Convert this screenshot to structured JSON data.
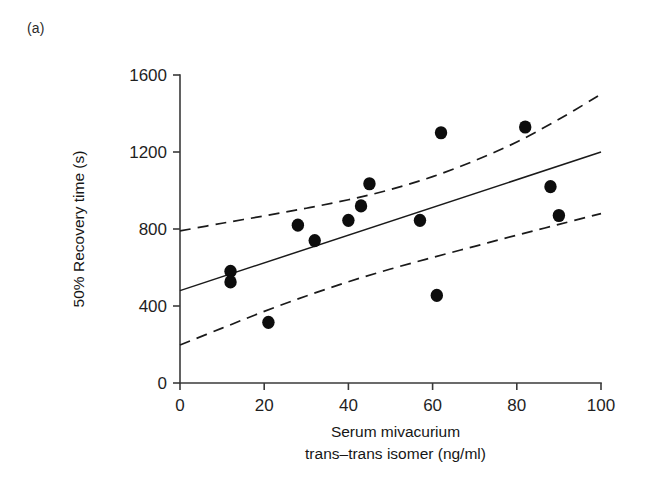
{
  "panel": {
    "label": "(a)"
  },
  "chart_data": {
    "type": "scatter",
    "title": "",
    "subtitle": "",
    "xlabel_line1": "Serum mivacurium",
    "xlabel_line2_italic": "trans–trans",
    "xlabel_line2_rest": " isomer (ng/ml)",
    "ylabel": "50% Recovery time (s)",
    "xlim": [
      0,
      100
    ],
    "ylim": [
      0,
      1600
    ],
    "xticks": [
      0,
      20,
      40,
      60,
      80,
      100
    ],
    "xtick_labels": [
      "0",
      "20",
      "40",
      "60",
      "80",
      "100"
    ],
    "yticks": [
      0,
      400,
      800,
      1200,
      1600
    ],
    "ytick_labels": [
      "0",
      "400",
      "800",
      "1200",
      "1600"
    ],
    "grid": false,
    "legend": false,
    "marker_color": "#0d0d0d",
    "line_color": "#1a1a1a",
    "points": [
      {
        "x": 12,
        "y": 580
      },
      {
        "x": 12,
        "y": 525
      },
      {
        "x": 21,
        "y": 315
      },
      {
        "x": 28,
        "y": 820
      },
      {
        "x": 32,
        "y": 740
      },
      {
        "x": 40,
        "y": 845
      },
      {
        "x": 43,
        "y": 920
      },
      {
        "x": 45,
        "y": 1035
      },
      {
        "x": 57,
        "y": 845
      },
      {
        "x": 61,
        "y": 455
      },
      {
        "x": 62,
        "y": 1300
      },
      {
        "x": 82,
        "y": 1330
      },
      {
        "x": 88,
        "y": 1020
      },
      {
        "x": 90,
        "y": 870
      }
    ],
    "series": [
      {
        "name": "regression-line",
        "style": "solid",
        "points": [
          {
            "x": 0,
            "y": 480
          },
          {
            "x": 100,
            "y": 1200
          }
        ]
      },
      {
        "name": "upper-confidence-band",
        "style": "dashed",
        "points": [
          {
            "x": 0,
            "y": 790
          },
          {
            "x": 10,
            "y": 830
          },
          {
            "x": 20,
            "y": 868
          },
          {
            "x": 30,
            "y": 908
          },
          {
            "x": 40,
            "y": 952
          },
          {
            "x": 50,
            "y": 1005
          },
          {
            "x": 60,
            "y": 1072
          },
          {
            "x": 70,
            "y": 1155
          },
          {
            "x": 80,
            "y": 1252
          },
          {
            "x": 90,
            "y": 1370
          },
          {
            "x": 100,
            "y": 1500
          }
        ]
      },
      {
        "name": "lower-confidence-band",
        "style": "dashed",
        "points": [
          {
            "x": 0,
            "y": 197
          },
          {
            "x": 10,
            "y": 285
          },
          {
            "x": 20,
            "y": 372
          },
          {
            "x": 30,
            "y": 452
          },
          {
            "x": 40,
            "y": 526
          },
          {
            "x": 50,
            "y": 592
          },
          {
            "x": 60,
            "y": 652
          },
          {
            "x": 70,
            "y": 710
          },
          {
            "x": 80,
            "y": 768
          },
          {
            "x": 90,
            "y": 824
          },
          {
            "x": 100,
            "y": 880
          }
        ]
      }
    ]
  }
}
